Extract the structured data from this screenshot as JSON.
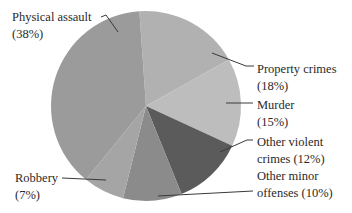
{
  "chart_data": {
    "type": "pie",
    "title": "",
    "start_angle_deg": -4,
    "direction": "clockwise",
    "center": [
      146,
      106
    ],
    "radius": 95,
    "categories": [
      "Property crimes",
      "Murder",
      "Other violent crimes",
      "Other minor offenses",
      "Robbery",
      "Physical assault"
    ],
    "values": [
      18,
      15,
      12,
      10,
      7,
      38
    ],
    "unit": "%",
    "colors": [
      "#b1b1b1",
      "#bdbdbd",
      "#5b5b5b",
      "#8b8b8b",
      "#a5a5a5",
      "#9b9b9b"
    ],
    "labels": [
      {
        "line1": "Property crimes",
        "line2": "(18%)"
      },
      {
        "line1": "Murder",
        "line2": "(15%)"
      },
      {
        "line1": "Other violent",
        "line2": "crimes (12%)"
      },
      {
        "line1": "Other minor",
        "line2": "offenses (10%)"
      },
      {
        "line1": "Robbery",
        "line2": "(7%)"
      },
      {
        "line1": "Physical assault",
        "line2": "(38%)"
      }
    ],
    "legend": "none (direct labels with leader lines)"
  }
}
